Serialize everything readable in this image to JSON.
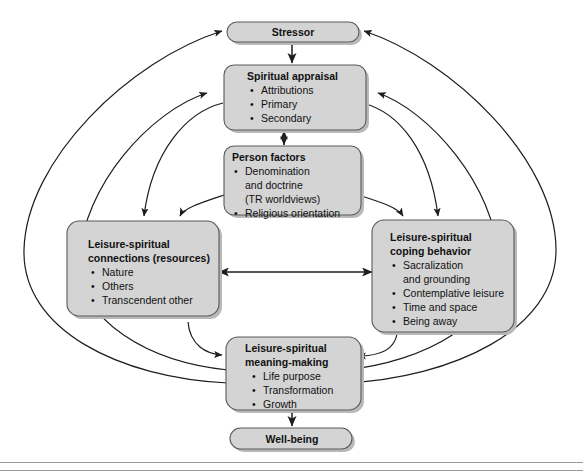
{
  "figure": {
    "type": "conceptual-flow-diagram",
    "colors": {
      "node_fill": "#d4d4d4",
      "node_border": "#5a5a5a",
      "node_shadow": "#b9b9b9",
      "arrow": "#1d1d1d",
      "background": "#ffffff",
      "rule": "#9a9a9a"
    }
  },
  "nodes": {
    "stressor": {
      "id": "stressor",
      "shape": "pill",
      "title": "Stressor",
      "bullets": []
    },
    "spiritual_appraisal": {
      "id": "spiritual-appraisal",
      "shape": "rounded-rect",
      "title": "Spiritual appraisal",
      "bullets": [
        "Attributions",
        "Primary",
        "Secondary"
      ]
    },
    "person_factors": {
      "id": "person-factors",
      "shape": "rounded-rect",
      "title": "Person factors",
      "bullets": [
        "Denomination",
        "and doctrine",
        "(TR worldviews)",
        "Religious orientation"
      ],
      "bullet_markers": [
        true,
        false,
        false,
        true
      ]
    },
    "connections": {
      "id": "leisure-spiritual-connections",
      "shape": "rounded-rect",
      "title_line1": "Leisure-spiritual",
      "title_line2": "connections (resources)",
      "bullets": [
        "Nature",
        "Others",
        "Transcendent other"
      ]
    },
    "coping": {
      "id": "leisure-spiritual-coping-behavior",
      "shape": "rounded-rect",
      "title_line1": "Leisure-spiritual",
      "title_line2": "coping behavior",
      "bullets": [
        "Sacralization",
        "and grounding",
        "Contemplative leisure",
        "Time and space",
        "Being away"
      ],
      "bullet_markers": [
        true,
        false,
        true,
        true,
        true
      ]
    },
    "meaning_making": {
      "id": "leisure-spiritual-meaning-making",
      "shape": "rounded-rect",
      "title_line1": "Leisure-spiritual",
      "title_line2": "meaning-making",
      "bullets": [
        "Life purpose",
        "Transformation",
        "Growth"
      ]
    },
    "wellbeing": {
      "id": "well-being",
      "shape": "pill",
      "title": "Well-being",
      "bullets": []
    }
  },
  "connections": [
    {
      "from": "stressor",
      "to": "spiritual_appraisal",
      "style": "straight",
      "heads": "single"
    },
    {
      "from": "spiritual_appraisal",
      "to": "person_factors",
      "style": "straight",
      "heads": "double"
    },
    {
      "from": "person_factors",
      "to": "connections",
      "style": "curved",
      "heads": "single"
    },
    {
      "from": "person_factors",
      "to": "coping",
      "style": "curved",
      "heads": "single"
    },
    {
      "from": "spiritual_appraisal",
      "to": "connections",
      "style": "curved",
      "heads": "single"
    },
    {
      "from": "spiritual_appraisal",
      "to": "coping",
      "style": "curved",
      "heads": "single"
    },
    {
      "from": "connections",
      "to": "coping",
      "style": "straight",
      "heads": "double"
    },
    {
      "from": "connections",
      "to": "meaning_making",
      "style": "curved",
      "heads": "single"
    },
    {
      "from": "coping",
      "to": "meaning_making",
      "style": "curved",
      "heads": "single"
    },
    {
      "from": "meaning_making",
      "to": "spiritual_appraisal",
      "style": "curved-outer-left",
      "heads": "single"
    },
    {
      "from": "meaning_making",
      "to": "spiritual_appraisal",
      "style": "curved-outer-right",
      "heads": "single"
    },
    {
      "from": "meaning_making",
      "to": "stressor",
      "style": "curved-outer-left",
      "heads": "single"
    },
    {
      "from": "meaning_making",
      "to": "stressor",
      "style": "curved-outer-right",
      "heads": "single"
    },
    {
      "from": "meaning_making",
      "to": "wellbeing",
      "style": "straight",
      "heads": "single"
    }
  ],
  "bullet_glyph": "•"
}
